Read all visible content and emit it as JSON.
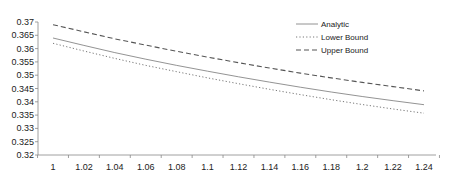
{
  "chart_data": {
    "type": "line",
    "title": "",
    "xlabel": "",
    "ylabel": "",
    "xlim": [
      0.99,
      1.25
    ],
    "ylim": [
      0.32,
      0.37
    ],
    "grid": false,
    "legend_position": "top-right-inside",
    "x_ticks": [
      "1",
      "1.02",
      "1.04",
      "1.06",
      "1.08",
      "1.1",
      "1.12",
      "1.14",
      "1.16",
      "1.18",
      "1.2",
      "1.22",
      "1.24"
    ],
    "y_ticks": [
      "0.32",
      "0.325",
      "0.33",
      "0.335",
      "0.34",
      "0.345",
      "0.35",
      "0.355",
      "0.36",
      "0.365",
      "0.37"
    ],
    "x": [
      1.0,
      1.02,
      1.04,
      1.06,
      1.08,
      1.1,
      1.12,
      1.14,
      1.16,
      1.18,
      1.2,
      1.22,
      1.24
    ],
    "series": [
      {
        "name": "Analytic",
        "style": "solid",
        "color": "#777777",
        "values": [
          0.364,
          0.3612,
          0.3585,
          0.356,
          0.3537,
          0.3515,
          0.3494,
          0.3474,
          0.3455,
          0.3437,
          0.342,
          0.3404,
          0.3389
        ]
      },
      {
        "name": "Lower Bound",
        "style": "dotted",
        "color": "#777777",
        "values": [
          0.362,
          0.3591,
          0.3563,
          0.3537,
          0.3513,
          0.349,
          0.3468,
          0.3447,
          0.3427,
          0.3408,
          0.339,
          0.3373,
          0.3357
        ]
      },
      {
        "name": "Upper Bound",
        "style": "dashed",
        "color": "#555555",
        "values": [
          0.369,
          0.3663,
          0.3637,
          0.3613,
          0.359,
          0.3568,
          0.3547,
          0.3527,
          0.3508,
          0.349,
          0.3473,
          0.3457,
          0.3441
        ]
      }
    ]
  },
  "legend": {
    "items": [
      {
        "label": "Analytic"
      },
      {
        "label": "Lower Bound"
      },
      {
        "label": "Upper Bound"
      }
    ]
  }
}
